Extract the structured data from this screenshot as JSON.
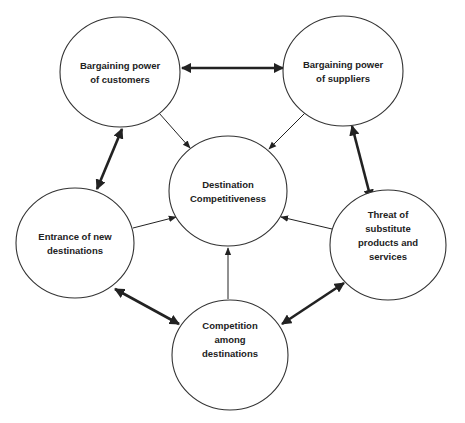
{
  "diagram": {
    "type": "five-forces-network",
    "colors": {
      "stroke": "#222222",
      "text": "#222222",
      "background": "#ffffff"
    },
    "nodes": [
      {
        "id": "customers",
        "lines": [
          "Bargaining power",
          "of customers"
        ],
        "cx": 120,
        "cy": 72,
        "rx": 60,
        "ry": 55
      },
      {
        "id": "suppliers",
        "lines": [
          "Bargaining power",
          "of suppliers"
        ],
        "cx": 343,
        "cy": 71,
        "rx": 60,
        "ry": 55
      },
      {
        "id": "center",
        "lines": [
          "Destination",
          "Competitiveness"
        ],
        "cx": 228,
        "cy": 191,
        "rx": 59,
        "ry": 55
      },
      {
        "id": "new-entrants",
        "lines": [
          "Entrance of new",
          "destinations"
        ],
        "cx": 75,
        "cy": 243,
        "rx": 59,
        "ry": 55
      },
      {
        "id": "substitutes",
        "lines": [
          "Threat of",
          "substitute",
          "products and",
          "services"
        ],
        "cx": 388,
        "cy": 245,
        "rx": 58,
        "ry": 55
      },
      {
        "id": "rivalry",
        "lines": [
          "Competition",
          "among",
          "destinations"
        ],
        "cx": 230,
        "cy": 355,
        "rx": 58,
        "ry": 55
      }
    ],
    "edges": [
      {
        "from": "customers",
        "to": "suppliers",
        "style": "thick",
        "direction": "both"
      },
      {
        "from": "customers",
        "to": "new-entrants",
        "style": "thick",
        "direction": "both"
      },
      {
        "from": "suppliers",
        "to": "substitutes",
        "style": "thick",
        "direction": "both"
      },
      {
        "from": "new-entrants",
        "to": "rivalry",
        "style": "thick",
        "direction": "both"
      },
      {
        "from": "substitutes",
        "to": "rivalry",
        "style": "thick",
        "direction": "both"
      },
      {
        "from": "customers",
        "to": "center",
        "style": "thin",
        "direction": "forward"
      },
      {
        "from": "suppliers",
        "to": "center",
        "style": "thin",
        "direction": "forward"
      },
      {
        "from": "new-entrants",
        "to": "center",
        "style": "thin",
        "direction": "forward"
      },
      {
        "from": "substitutes",
        "to": "center",
        "style": "thin",
        "direction": "forward"
      },
      {
        "from": "rivalry",
        "to": "center",
        "style": "thin",
        "direction": "forward"
      }
    ]
  },
  "labels": {
    "customers": {
      "line1": "Bargaining power",
      "line2": "of customers"
    },
    "suppliers": {
      "line1": "Bargaining power",
      "line2": "of suppliers"
    },
    "center": {
      "line1": "Destination",
      "line2": "Competitiveness"
    },
    "new_entrants": {
      "line1": "Entrance of new",
      "line2": "destinations"
    },
    "substitutes": {
      "line1": "Threat of",
      "line2": "substitute",
      "line3": "products and",
      "line4": "services"
    },
    "rivalry": {
      "line1": "Competition",
      "line2": "among",
      "line3": "destinations"
    }
  }
}
